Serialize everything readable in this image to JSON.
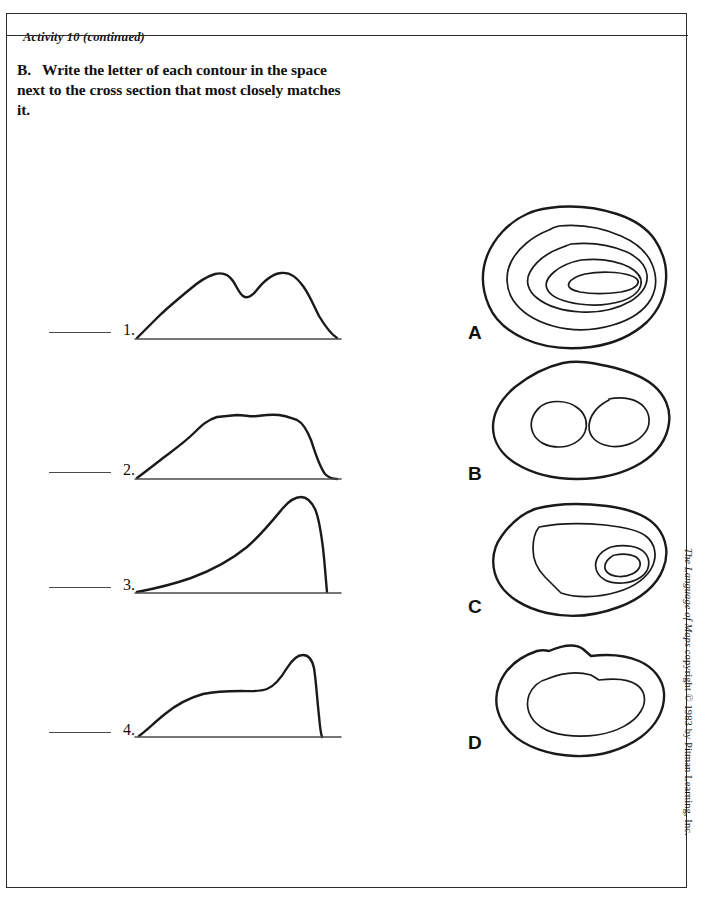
{
  "page": {
    "running_head": "Activity 10 (continued)",
    "copyright_italic": "The Language of Maps",
    "copyright_rest": " copyright © 1983 by Pitman Learning, Inc."
  },
  "instructions": {
    "part_letter": "B.",
    "text": "Write the letter of each contour in the space next to the cross section that most closely matches it."
  },
  "cross_sections": [
    {
      "number": "1.",
      "answer_value": "",
      "description": "twin-peaked ridge, two summits of nearly equal height separated by a shallow saddle, gentle slopes on both flanks"
    },
    {
      "number": "2.",
      "answer_value": "",
      "description": "broad flat-topped plateau with gently sloping left flank and steeper right flank"
    },
    {
      "number": "3.",
      "answer_value": "",
      "description": "single asymmetric peak, long gradual rise from the left, near-vertical cliff drop on the right"
    },
    {
      "number": "4.",
      "answer_value": "",
      "description": "low shelf or bench across the middle rising to a single sharp peak on the right with a steep drop"
    }
  ],
  "contour_maps": [
    {
      "letter": "A",
      "description": "five nested closed contours, evenly spaced on the left and bunched tightly on the right, innermost an elongated oval summit"
    },
    {
      "letter": "B",
      "description": "one outer closed contour enclosing two separate small closed contours, indicating two summits"
    },
    {
      "letter": "C",
      "description": "outer contour with a large inner terrace contour and two small tight contours around a summit at the right end"
    },
    {
      "letter": "D",
      "description": "two widely spaced closed contours enclosing a large flat interior, indicating a plateau"
    }
  ]
}
